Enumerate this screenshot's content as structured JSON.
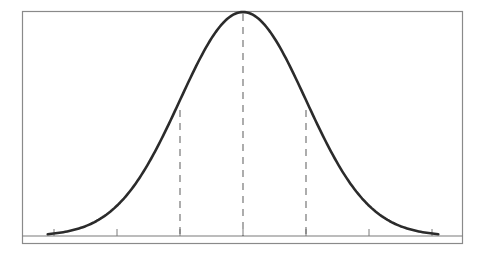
{
  "chart_data": {
    "type": "line",
    "title": "",
    "xlabel": "",
    "ylabel": "",
    "x_ticks": [
      -3,
      -2,
      -1,
      0,
      1,
      2,
      3
    ],
    "tick_labels": [],
    "xlim": [
      -3.25,
      3.25
    ],
    "ylim": [
      0,
      1
    ],
    "grid": false,
    "legend": null,
    "mean": 0,
    "sd": 1,
    "dashed_markers": [
      -1,
      0,
      1
    ],
    "series": [
      {
        "name": "normal density (normalized to peak)",
        "x": [
          -3.1,
          -3,
          -2.5,
          -2,
          -1.5,
          -1,
          -0.5,
          0,
          0.5,
          1,
          1.5,
          2,
          2.5,
          3,
          3.1
        ],
        "values": [
          0.008,
          0.011,
          0.044,
          0.135,
          0.325,
          0.607,
          0.882,
          1.0,
          0.882,
          0.607,
          0.325,
          0.135,
          0.044,
          0.011,
          0.008
        ]
      }
    ]
  },
  "colors": {
    "curve": "#2b2b2b",
    "frame": "#8a8a8a",
    "axis": "#7a7a7a",
    "dash": "#6a6a6a",
    "background": "#ffffff"
  }
}
